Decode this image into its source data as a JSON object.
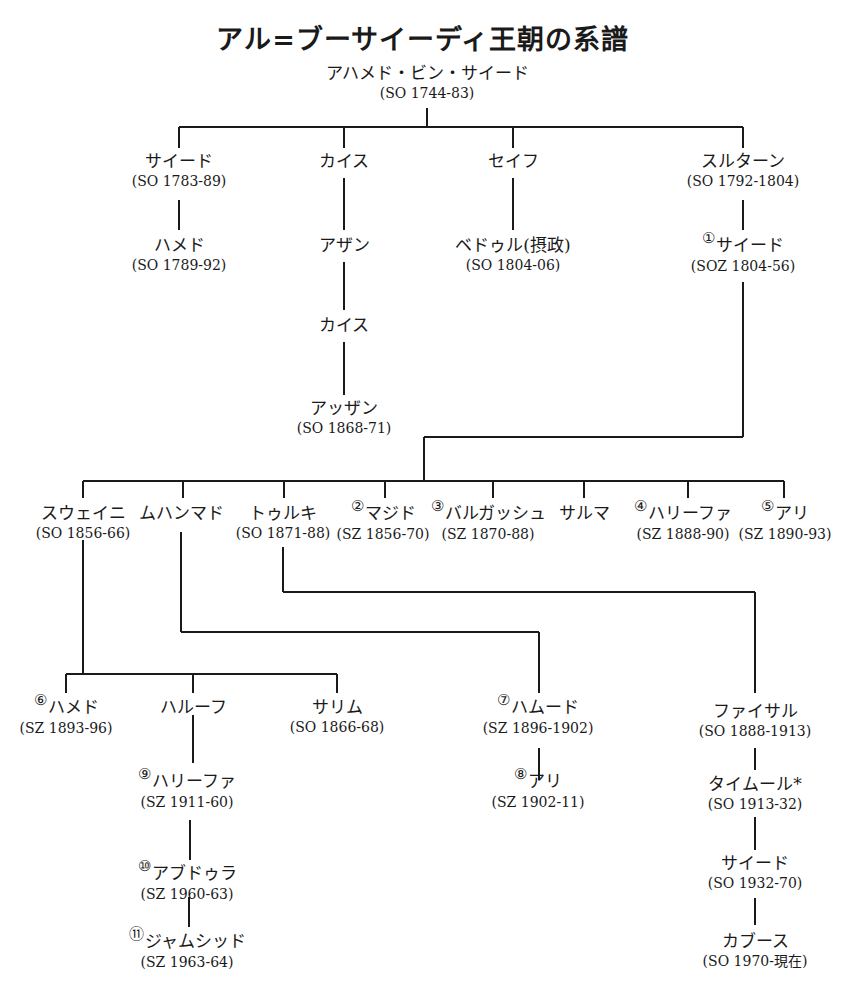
{
  "title": "アル=ブーサイーディ王朝の系譜",
  "nodes": {
    "ahmad": {
      "name": "アハメド・ビン・サイード",
      "reign": "(SO 1744-83)"
    },
    "said1": {
      "name": "サイード",
      "reign": "(SO 1783-89)"
    },
    "hamed1": {
      "name": "ハメド",
      "reign": "(SO 1789-92)"
    },
    "qais1": {
      "name": "カイス",
      "reign": ""
    },
    "azzan1": {
      "name": "アザン",
      "reign": ""
    },
    "qais2": {
      "name": "カイス",
      "reign": ""
    },
    "azzan2": {
      "name": "アッザン",
      "reign": "(SO 1868-71)"
    },
    "seif": {
      "name": "セイフ",
      "reign": ""
    },
    "bedr": {
      "name": "ベドゥル(摂政)",
      "reign": "(SO 1804-06)"
    },
    "sultan": {
      "name": "スルターン",
      "reign": "(SO 1792-1804)"
    },
    "said2": {
      "num": "①",
      "name": "サイード",
      "reign": "(SOZ 1804-56)"
    },
    "thuwaini": {
      "name": "スウェイニ",
      "reign": "(SO 1856-66)"
    },
    "muhammad": {
      "name": "ムハンマド",
      "reign": ""
    },
    "turki": {
      "name": "トゥルキ",
      "reign": "(SO 1871-88)"
    },
    "majid": {
      "num": "②",
      "name": "マジド",
      "reign": "(SZ 1856-70)"
    },
    "barghash": {
      "num": "③",
      "name": "バルガッシュ",
      "reign": "(SZ 1870-88)"
    },
    "salma": {
      "name": "サルマ",
      "reign": ""
    },
    "khalifa1": {
      "num": "④",
      "name": "ハリーファ",
      "reign": "(SZ 1888-90)"
    },
    "ali1": {
      "num": "⑤",
      "name": "アリ",
      "reign": "(SZ 1890-93)"
    },
    "hamed2": {
      "num": "⑥",
      "name": "ハメド",
      "reign": "(SZ 1893-96)"
    },
    "harub": {
      "name": "ハルーフ",
      "reign": ""
    },
    "salim": {
      "name": "サリム",
      "reign": "(SO 1866-68)"
    },
    "khalifa2": {
      "num": "⑨",
      "name": "ハリーファ",
      "reign": "(SZ 1911-60)"
    },
    "abdulla": {
      "num": "⑩",
      "name": "アブドゥラ",
      "reign": "(SZ 1960-63)"
    },
    "jamshid": {
      "num": "⑪",
      "name": "ジャムシッド",
      "reign": "(SZ 1963-64)"
    },
    "hamud": {
      "num": "⑦",
      "name": "ハムード",
      "reign": "(SZ 1896-1902)"
    },
    "ali2": {
      "num": "⑧",
      "name": "アリ",
      "reign": "(SZ 1902-11)"
    },
    "faisal": {
      "name": "ファイサル",
      "reign": "(SO 1888-1913)"
    },
    "taimur": {
      "name": "タイムール*",
      "reign": "(SO 1913-32)"
    },
    "said3": {
      "name": "サイード",
      "reign": "(SO 1932-70)"
    },
    "qaboos": {
      "name": "カブース",
      "reign": "(SO 1970-現在)"
    }
  }
}
